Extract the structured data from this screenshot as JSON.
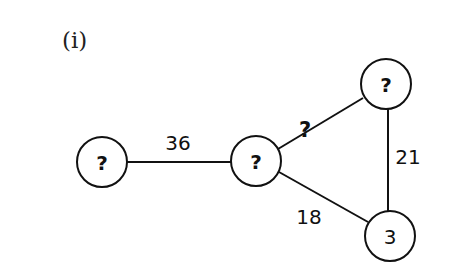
{
  "part_label": "(i)",
  "nodes": [
    {
      "id": "a",
      "label": "?",
      "cx": 102,
      "cy": 162
    },
    {
      "id": "b",
      "label": "?",
      "cx": 256,
      "cy": 161
    },
    {
      "id": "c",
      "label": "?",
      "cx": 386,
      "cy": 84
    },
    {
      "id": "d",
      "label": "3",
      "cx": 390,
      "cy": 236
    }
  ],
  "edges": [
    {
      "from": "a",
      "to": "b",
      "label": "36"
    },
    {
      "from": "b",
      "to": "c",
      "label": "?"
    },
    {
      "from": "c",
      "to": "d",
      "label": "21"
    },
    {
      "from": "b",
      "to": "d",
      "label": "18"
    }
  ],
  "colors": {
    "stroke": "#111111",
    "background": "#ffffff"
  }
}
